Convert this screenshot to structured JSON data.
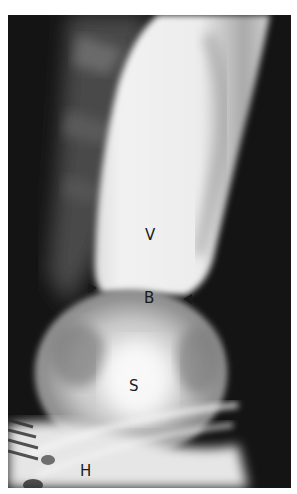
{
  "figure": {
    "type": "radiograph",
    "labels": {
      "vestibule": "V",
      "ring": "B",
      "hernia_sac": "S",
      "hiatus": "H"
    },
    "annotations": [
      {
        "kind": "arrowhead",
        "direction": "right",
        "side": "left"
      },
      {
        "kind": "arrowhead",
        "direction": "left",
        "side": "right"
      }
    ]
  }
}
